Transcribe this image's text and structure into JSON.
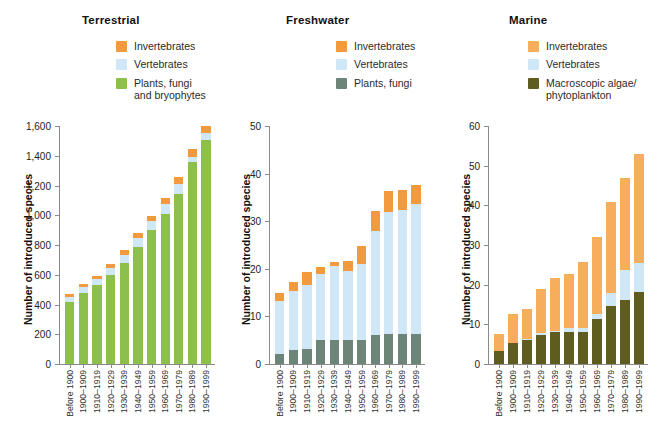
{
  "figure": {
    "type": "grouped-stacked-bar-figure",
    "panel_count": 3
  },
  "chart_data": [
    {
      "type": "bar",
      "title": "Terrestrial",
      "xlabel": "",
      "ylabel": "Number of introduced species",
      "ylim": [
        0,
        1600
      ],
      "yticks": [
        "0",
        "200",
        "400",
        "600",
        "800",
        "1,000",
        "1,200",
        "1,400",
        "1,600"
      ],
      "ytick_values": [
        0,
        200,
        400,
        600,
        800,
        1000,
        1200,
        1400,
        1600
      ],
      "grid": false,
      "stacked": true,
      "legend_position": "top-right",
      "categories": [
        "Before 1900",
        "1900–1909",
        "1910–1919",
        "1920–1929",
        "1930–1939",
        "1940–1949",
        "1950–1959",
        "1960–1969",
        "1970–1979",
        "1980–1989",
        "1990–1999"
      ],
      "series": [
        {
          "name": "Plants, fungi and bryophytes",
          "color": "#8cc04b",
          "values": [
            420,
            480,
            530,
            600,
            680,
            790,
            900,
            1010,
            1140,
            1360,
            1510
          ]
        },
        {
          "name": "Vertebrates",
          "color": "#cfe7f7",
          "values": [
            30,
            35,
            40,
            45,
            50,
            55,
            60,
            65,
            70,
            35,
            45
          ]
        },
        {
          "name": "Invertebrates",
          "color": "#f49a3e",
          "values": [
            20,
            25,
            25,
            30,
            35,
            35,
            35,
            40,
            45,
            50,
            50
          ]
        }
      ],
      "totals": [
        470,
        540,
        595,
        675,
        765,
        880,
        995,
        1115,
        1255,
        1445,
        1605
      ]
    },
    {
      "type": "bar",
      "title": "Freshwater",
      "xlabel": "",
      "ylabel": "Number of introduced species",
      "ylim": [
        0,
        50
      ],
      "yticks": [
        "0",
        "10",
        "20",
        "30",
        "40",
        "50"
      ],
      "ytick_values": [
        0,
        10,
        20,
        30,
        40,
        50
      ],
      "grid": false,
      "stacked": true,
      "legend_position": "top-right",
      "categories": [
        "Before 1900",
        "1900–1909",
        "1910–1919",
        "1920–1929",
        "1930–1939",
        "1940–1949",
        "1950–1959",
        "1960–1969",
        "1970–1979",
        "1980–1989",
        "1990–1999"
      ],
      "series": [
        {
          "name": "Plants, fungi",
          "color": "#6d8478",
          "values": [
            2,
            3,
            3.2,
            5,
            5,
            5,
            5,
            6.2,
            6.3,
            6.3,
            6.3
          ]
        },
        {
          "name": "Vertebrates",
          "color": "#cfe7f7",
          "values": [
            11.2,
            12.4,
            13.4,
            13.9,
            15.6,
            14.6,
            16,
            21.8,
            25.7,
            26,
            27.3
          ]
        },
        {
          "name": "Invertebrates",
          "color": "#f49a3e",
          "values": [
            1.8,
            1.9,
            2.7,
            1.5,
            0.9,
            2,
            3.8,
            4.2,
            4.3,
            4.2,
            4.1
          ]
        }
      ],
      "totals": [
        15,
        17.3,
        19.3,
        20.4,
        21.5,
        21.6,
        24.8,
        32.2,
        36.3,
        36.5,
        37.7
      ]
    },
    {
      "type": "bar",
      "title": "Marine",
      "xlabel": "",
      "ylabel": "Number of introduced species",
      "ylim": [
        0,
        60
      ],
      "yticks": [
        "0",
        "10",
        "20",
        "30",
        "40",
        "50",
        "60"
      ],
      "ytick_values": [
        0,
        10,
        20,
        30,
        40,
        50,
        60
      ],
      "grid": false,
      "stacked": true,
      "legend_position": "top-right",
      "categories": [
        "Before 1900",
        "1900–1909",
        "1910–1919",
        "1920–1929",
        "1930–1939",
        "1940–1949",
        "1950–1959",
        "1960–1969",
        "1970–1979",
        "1980–1989",
        "1990–1999"
      ],
      "series": [
        {
          "name": "Macroscopic algae/phytoplankton",
          "color": "#5e5c1f",
          "values": [
            3.2,
            5.2,
            6.1,
            7.4,
            8,
            8,
            8.1,
            11.3,
            14.5,
            16.2,
            18.2
          ]
        },
        {
          "name": "Vertebrates",
          "color": "#cfe7f7",
          "values": [
            0.2,
            0.2,
            0.2,
            0.3,
            0.4,
            1,
            1.1,
            1.2,
            3.4,
            7.6,
            7.3
          ]
        },
        {
          "name": "Invertebrates",
          "color": "#f6ad5c",
          "values": [
            4.1,
            7.1,
            7.5,
            11.2,
            13.2,
            13.6,
            16.5,
            19.4,
            23,
            23.1,
            27.5
          ]
        }
      ],
      "totals": [
        7.5,
        12.5,
        13.8,
        18.9,
        21.6,
        22.6,
        25.7,
        31.9,
        40.9,
        46.9,
        53
      ]
    }
  ],
  "panels": [
    {
      "title": "Terrestrial",
      "ylabel": "Number of introduced species",
      "legend": [
        {
          "label": "Invertebrates",
          "label2": "",
          "color": "#f49a3e"
        },
        {
          "label": "Vertebrates",
          "label2": "",
          "color": "#cfe7f7"
        },
        {
          "label": "Plants, fungi",
          "label2": "and bryophytes",
          "color": "#8cc04b"
        }
      ]
    },
    {
      "title": "Freshwater",
      "ylabel": "Number of introduced species",
      "legend": [
        {
          "label": "Invertebrates",
          "label2": "",
          "color": "#f49a3e"
        },
        {
          "label": "Vertebrates",
          "label2": "",
          "color": "#cfe7f7"
        },
        {
          "label": "Plants, fungi",
          "label2": "",
          "color": "#6d8478"
        }
      ]
    },
    {
      "title": "Marine",
      "ylabel": "Number of introduced species",
      "legend": [
        {
          "label": "Invertebrates",
          "label2": "",
          "color": "#f6ad5c"
        },
        {
          "label": "Vertebrates",
          "label2": "",
          "color": "#cfe7f7"
        },
        {
          "label": "Macroscopic algae/",
          "label2": "phytoplankton",
          "color": "#5e5c1f"
        }
      ]
    }
  ],
  "colors": {
    "invertebrates": "#f49a3e",
    "invertebrates_marine": "#f6ad5c",
    "vertebrates": "#cfe7f7",
    "plants_terrestrial": "#8cc04b",
    "plants_freshwater": "#6d8478",
    "algae_marine": "#5e5c1f",
    "axis": "#8a8a8a",
    "text": "#1a1a1a"
  }
}
